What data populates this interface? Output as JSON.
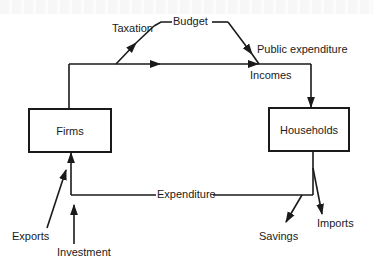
{
  "diagram": {
    "type": "circular-flow-of-income",
    "nodes": {
      "firms": "Firms",
      "households": "Households"
    },
    "labels": {
      "taxation": "Taxation",
      "budget": "Budget",
      "public_expenditure": "Public expenditure",
      "incomes": "Incomes",
      "expenditure": "Expenditure",
      "savings": "Savings",
      "imports": "Imports",
      "exports": "Exports",
      "investment": "Investment"
    },
    "edges": [
      {
        "from": "Firms",
        "to": "Households",
        "label": "Incomes"
      },
      {
        "from": "Incomes flow",
        "to": "Budget",
        "label": "Taxation"
      },
      {
        "from": "Budget",
        "to": "Incomes flow",
        "label": "Public expenditure"
      },
      {
        "from": "Households",
        "to": "Firms",
        "label": "Expenditure"
      },
      {
        "from": "Expenditure flow",
        "to": "out",
        "label": "Savings"
      },
      {
        "from": "Households",
        "to": "out",
        "label": "Imports"
      },
      {
        "from": "in",
        "to": "Firms",
        "label": "Exports"
      },
      {
        "from": "in",
        "to": "Expenditure flow",
        "label": "Investment"
      }
    ],
    "colors": {
      "line": "#1a1a1a",
      "background": "#ffffff"
    }
  }
}
